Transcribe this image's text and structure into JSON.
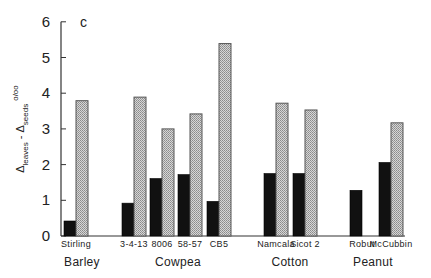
{
  "chart_data": {
    "type": "bar",
    "panel_label": "c",
    "title": "",
    "xlabel": "",
    "ylabel": "Δleaves - Δseeds ‰",
    "ylabel_parts": {
      "delta1": "Δ",
      "sub1": "leaves",
      "dash": " - ",
      "delta2": "Δ",
      "sub2": "seeds",
      "unit": "o/oo"
    },
    "ylim": [
      0,
      6
    ],
    "yticks": [
      0,
      1,
      2,
      3,
      4,
      5,
      6
    ],
    "grid": false,
    "legend": null,
    "groups": [
      {
        "name": "Barley",
        "categories": [
          "Stirling"
        ]
      },
      {
        "name": "Cowpea",
        "categories": [
          "3-4-13",
          "8006",
          "58-57",
          "CB5"
        ]
      },
      {
        "name": "Cotton",
        "categories": [
          "Namcala",
          "Sicot 2"
        ]
      },
      {
        "name": "Peanut",
        "categories": [
          "Robut",
          "McCubbin"
        ]
      }
    ],
    "categories": [
      "Stirling",
      "3-4-13",
      "8006",
      "58-57",
      "CB5",
      "Namcala",
      "Sicot 2",
      "Robut",
      "McCubbin"
    ],
    "series": [
      {
        "name": "solid (black)",
        "color": "#111111",
        "values": [
          0.42,
          0.92,
          1.61,
          1.72,
          0.97,
          1.75,
          1.75,
          1.28,
          2.06
        ]
      },
      {
        "name": "stippled (gray)",
        "color": "#bdbdbd",
        "values": [
          3.79,
          3.89,
          3.0,
          3.42,
          5.39,
          3.72,
          3.53,
          null,
          3.17
        ]
      }
    ]
  },
  "colors": {
    "solid": "#111111",
    "stipple": "#bdbdbd",
    "stipple_edge": "#555555",
    "axis": "#333333"
  }
}
